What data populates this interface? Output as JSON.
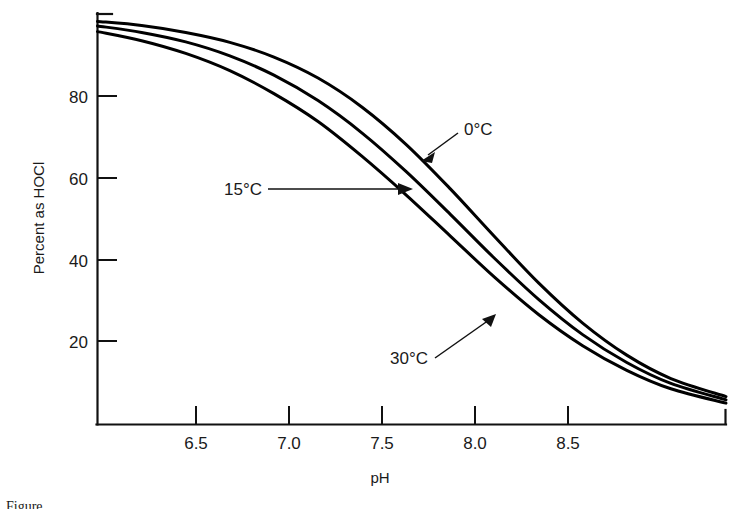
{
  "chart_data": {
    "type": "line",
    "title": "",
    "subtitle": "",
    "xlabel": "pH",
    "ylabel": "Percent as HOCl",
    "xlim": [
      6.1,
      8.95
    ],
    "ylim": [
      0,
      100
    ],
    "xticks": [
      "6.5",
      "7.0",
      "7.5",
      "8.0",
      "8.5"
    ],
    "xtick_values": [
      6.5,
      7.0,
      7.5,
      8.0,
      8.5
    ],
    "yticks": [
      "20",
      "40",
      "60",
      "80"
    ],
    "ytick_values": [
      20,
      40,
      60,
      80
    ],
    "grid": false,
    "legend_position": "inline-annotations",
    "x": [
      6.1,
      6.3,
      6.5,
      6.7,
      6.9,
      7.1,
      7.3,
      7.5,
      7.7,
      7.9,
      8.1,
      8.3,
      8.5,
      8.7,
      8.95
    ],
    "series": [
      {
        "name": "0°C",
        "label": "0°C",
        "pKa": 7.83,
        "color": "#000000",
        "values": [
          98.2,
          97.2,
          95.5,
          93.1,
          89.5,
          84.4,
          77.3,
          68.2,
          57.4,
          45.8,
          34.5,
          24.7,
          16.9,
          11.2,
          6.8
        ]
      },
      {
        "name": "15°C",
        "label": "15°C",
        "pKa": 7.63,
        "color": "#000000",
        "values": [
          97.1,
          95.5,
          93.2,
          89.8,
          85.1,
          78.9,
          71.0,
          61.6,
          51.2,
          40.5,
          30.5,
          21.9,
          15.1,
          10.0,
          6.0
        ]
      },
      {
        "name": "30°C",
        "label": "30°C",
        "pKa": 7.45,
        "color": "#000000",
        "values": [
          95.7,
          93.5,
          90.4,
          86.2,
          80.6,
          73.8,
          65.3,
          55.9,
          45.9,
          35.9,
          26.8,
          19.2,
          13.2,
          8.7,
          5.2
        ]
      }
    ],
    "annotations": [
      {
        "text": "0°C",
        "series": "0°C",
        "arrow": "diagonal-down-left"
      },
      {
        "text": "15°C",
        "series": "15°C",
        "arrow": "horizontal-right"
      },
      {
        "text": "30°C",
        "series": "30°C",
        "arrow": "diagonal-up-right"
      }
    ]
  },
  "axes": {
    "y_title": "Percent as HOCl",
    "x_title": "pH",
    "ytick_0": "80",
    "ytick_1": "60",
    "ytick_2": "40",
    "ytick_3": "20",
    "xtick_0": "6.5",
    "xtick_1": "7.0",
    "xtick_2": "7.5",
    "xtick_3": "8.0",
    "xtick_4": "8.5"
  },
  "labels": {
    "s0": "0°C",
    "s15": "15°C",
    "s30": "30°C"
  },
  "caption": {
    "text": "Figure"
  }
}
